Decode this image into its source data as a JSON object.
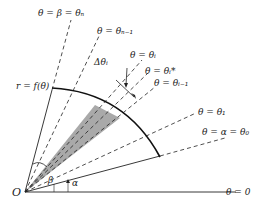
{
  "diagram": {
    "origin_label": "O",
    "curve_label": "r = f(θ)",
    "angle_labels": {
      "alpha": "α",
      "beta": "β",
      "delta": "Δθᵢ"
    },
    "rays": [
      {
        "id": "theta-zero",
        "label": "θ = 0"
      },
      {
        "id": "theta-alpha",
        "label": "θ = α = θ₀"
      },
      {
        "id": "theta-1",
        "label": "θ = θ₁"
      },
      {
        "id": "theta-i-minus-1",
        "label": "θ = θᵢ₋₁"
      },
      {
        "id": "theta-i-star",
        "label": "θ = θᵢ*"
      },
      {
        "id": "theta-i",
        "label": "θ = θᵢ"
      },
      {
        "id": "theta-n-minus-1",
        "label": "θ = θₙ₋₁"
      },
      {
        "id": "theta-beta",
        "label": "θ = β = θₙ"
      }
    ],
    "colors": {
      "line": "#222222",
      "shade": "#9a9a9a"
    }
  }
}
